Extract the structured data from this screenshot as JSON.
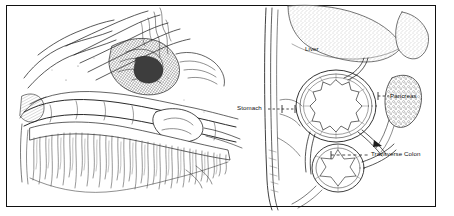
{
  "figure": {
    "type": "medical-illustration-plate",
    "panels": [
      {
        "id": "left",
        "name": "surgical-dissection-view",
        "description": "Pen-and-ink surgical illustration of the upper abdomen showing retracted tissue flaps, the transverse colon running horizontally, and the greater omentum hanging as a dense fringe below."
      },
      {
        "id": "right",
        "name": "sagittal-cross-section-diagram",
        "description": "Schematic sagittal cross-section of the abdomen showing liver, stomach, pancreas and transverse colon relative to the anterior abdominal wall."
      }
    ]
  },
  "labels": {
    "liver": "Liver",
    "stomach": "Stomach",
    "pancreas": "Pancreas",
    "transverse_colon": "Transverse Colon"
  },
  "colors": {
    "ink": "#111111",
    "line": "#2a2a2a",
    "hatch": "#4a4a4a",
    "stipple": "#9a9a9a",
    "paper": "#ffffff",
    "frame": "#111111"
  }
}
